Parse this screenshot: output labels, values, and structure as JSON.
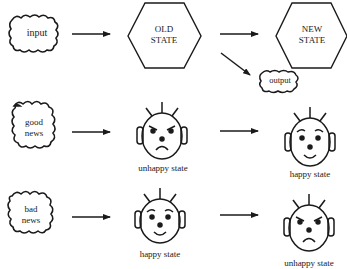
{
  "diagram": {
    "row1": {
      "input_label": "input",
      "old_state_line1": "OLD",
      "old_state_line2": "STATE",
      "new_state_line1": "NEW",
      "new_state_line2": "STATE",
      "output_label": "output"
    },
    "row2": {
      "input_line1": "good",
      "input_line2": "news",
      "old_state_caption": "unhappy state",
      "new_state_caption": "happy state"
    },
    "row3": {
      "input_line1": "bad",
      "input_line2": "news",
      "old_state_caption": "happy state",
      "new_state_caption": "unhappy state"
    }
  },
  "colors": {
    "ink": "#1a1a1a",
    "background": "#ffffff"
  }
}
